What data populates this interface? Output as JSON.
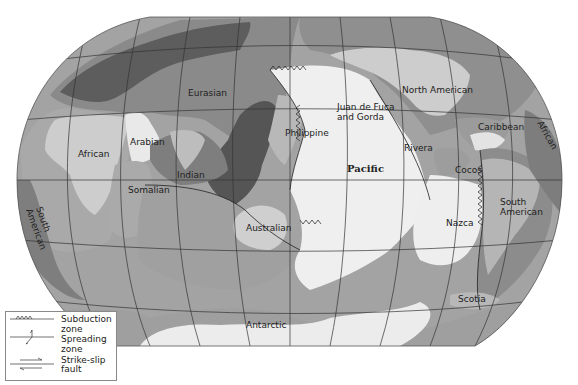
{
  "map": {
    "title": "Tectonic plates world map",
    "colors": {
      "background": "#ffffff",
      "ocean_plate_dark": "#8f8f8f",
      "ocean_plate_mid": "#a8a8a8",
      "ocean_plate_light": "#bdbdbd",
      "continent_light": "#cfcfcf",
      "pacific": "#efefef",
      "land_dark": "#5a5a5a",
      "graticule": "#333333"
    },
    "plates": [
      {
        "name": "Eurasian",
        "label": "Eurasian"
      },
      {
        "name": "African",
        "label": "African"
      },
      {
        "name": "Arabian",
        "label": "Arabian"
      },
      {
        "name": "Indian",
        "label": "Indian"
      },
      {
        "name": "Somalian",
        "label": "Somalian"
      },
      {
        "name": "Philippine",
        "label": "Philippine"
      },
      {
        "name": "Australian",
        "label": "Australian"
      },
      {
        "name": "Pacific",
        "label": "Pacific"
      },
      {
        "name": "Juan de Fuca and Gorda",
        "label_line1": "Juan de Fuca",
        "label_line2": "and Gorda"
      },
      {
        "name": "North American",
        "label": "North American"
      },
      {
        "name": "Caribbean",
        "label": "Caribbean"
      },
      {
        "name": "Rivera",
        "label": "Rivera"
      },
      {
        "name": "Cocos",
        "label": "Cocos"
      },
      {
        "name": "Nazca",
        "label": "Nazca"
      },
      {
        "name": "South American",
        "label_line1": "South",
        "label_line2": "American"
      },
      {
        "name": "South American (west edge)",
        "label_line1": "South",
        "label_line2": "American"
      },
      {
        "name": "African (east edge)",
        "label": "African"
      },
      {
        "name": "Scotia",
        "label": "Scotia"
      },
      {
        "name": "Antarctic",
        "label": "Antarctic"
      }
    ]
  },
  "legend": {
    "items": [
      {
        "symbol": "subduction",
        "label_line1": "Subduction",
        "label_line2": "zone"
      },
      {
        "symbol": "spreading",
        "label_line1": "Spreading",
        "label_line2": "zone"
      },
      {
        "symbol": "strike-slip",
        "label": "Strike-slip fault"
      }
    ]
  }
}
